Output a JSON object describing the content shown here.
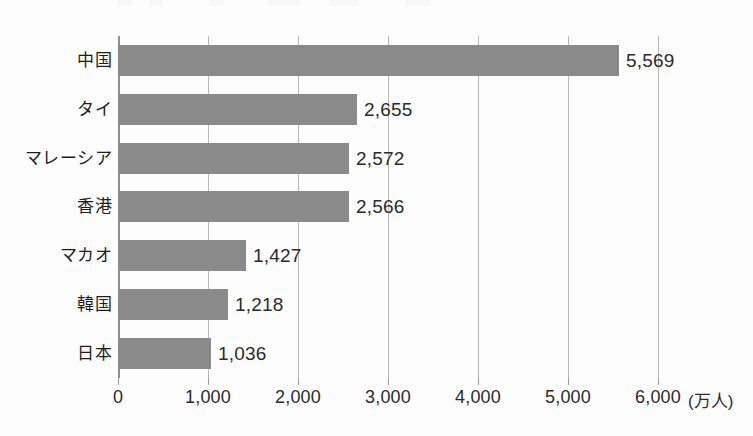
{
  "chart_data": {
    "type": "bar",
    "orientation": "horizontal",
    "title": "",
    "xlabel": "",
    "ylabel": "",
    "unit_label": "(万人)",
    "xlim": [
      0,
      6000
    ],
    "grid": true,
    "legend": "none",
    "categories": [
      "中国",
      "タイ",
      "マレーシア",
      "香港",
      "マカオ",
      "韓国",
      "日本"
    ],
    "values": [
      5569,
      2655,
      2572,
      2566,
      1427,
      1218,
      1036
    ],
    "value_labels": [
      "5,569",
      "2,655",
      "2,572",
      "2,566",
      "1,427",
      "1,218",
      "1,036"
    ],
    "xticks": [
      0,
      1000,
      2000,
      3000,
      4000,
      5000,
      6000
    ],
    "xtick_labels": [
      "0",
      "1,000",
      "2,000",
      "3,000",
      "4,000",
      "5,000",
      "6,000"
    ],
    "bar_color": "#8a8a8a",
    "gridline_color": "#b8b8b8",
    "axis_color": "#8f8f8f",
    "text_color": "#2b2b2b"
  }
}
